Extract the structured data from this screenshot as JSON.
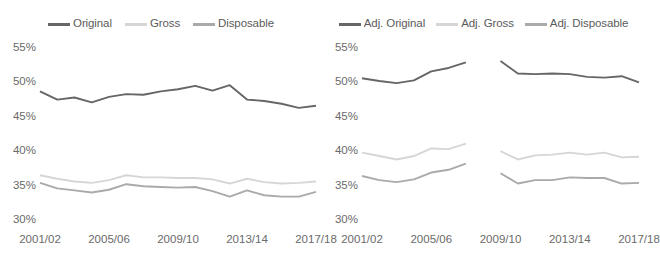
{
  "chart_data": [
    {
      "type": "line",
      "panel": "left",
      "title": "",
      "xlabel": "",
      "ylabel": "",
      "ylim": [
        30,
        55
      ],
      "ytick_labels": [
        "55%",
        "50%",
        "45%",
        "40%",
        "35%",
        "30%"
      ],
      "yticks": [
        55,
        50,
        45,
        40,
        35,
        30
      ],
      "grid": false,
      "legend_position": "top-center",
      "x": [
        "2001/02",
        "2002/03",
        "2003/04",
        "2004/05",
        "2005/06",
        "2006/07",
        "2007/08",
        "2008/09",
        "2009/10",
        "2010/11",
        "2011/12",
        "2012/13",
        "2013/14",
        "2014/15",
        "2015/16",
        "2016/17",
        "2017/18"
      ],
      "xtick_labels": [
        "2001/02",
        "2005/06",
        "2009/10",
        "2013/14",
        "2017/18"
      ],
      "xticks_index": [
        0,
        4,
        8,
        12,
        16
      ],
      "series": [
        {
          "name": "Original",
          "color": "#666666",
          "values": [
            48.7,
            47.5,
            47.8,
            47.1,
            47.9,
            48.3,
            48.2,
            48.7,
            49.0,
            49.5,
            48.8,
            49.6,
            47.5,
            47.3,
            46.9,
            46.3,
            46.6
          ]
        },
        {
          "name": "Gross",
          "color": "#d6d6d6",
          "values": [
            36.5,
            36.0,
            35.6,
            35.4,
            35.8,
            36.5,
            36.2,
            36.2,
            36.1,
            36.1,
            35.9,
            35.3,
            36.0,
            35.5,
            35.3,
            35.4,
            35.6
          ]
        },
        {
          "name": "Disposable",
          "color": "#aaaaaa",
          "values": [
            35.4,
            34.6,
            34.3,
            34.0,
            34.4,
            35.2,
            34.9,
            34.8,
            34.7,
            34.8,
            34.2,
            33.4,
            34.3,
            33.6,
            33.4,
            33.4,
            34.1
          ]
        }
      ]
    },
    {
      "type": "line",
      "panel": "right",
      "title": "",
      "xlabel": "",
      "ylabel": "",
      "ylim": [
        30,
        55
      ],
      "ytick_labels": [
        "55%",
        "50%",
        "45%",
        "40%",
        "35%",
        "30%"
      ],
      "yticks": [
        55,
        50,
        45,
        40,
        35,
        30
      ],
      "grid": false,
      "legend_position": "top-center",
      "note": "Series break between 2007/08 and 2009/10",
      "x": [
        "2001/02",
        "2002/03",
        "2003/04",
        "2004/05",
        "2005/06",
        "2006/07",
        "2007/08",
        "2008/09",
        "2009/10",
        "2010/11",
        "2011/12",
        "2012/13",
        "2013/14",
        "2014/15",
        "2015/16",
        "2016/17",
        "2017/18"
      ],
      "xtick_labels": [
        "2001/02",
        "2005/06",
        "2009/10",
        "2013/14",
        "2017/18"
      ],
      "xticks_index": [
        0,
        4,
        8,
        12,
        16
      ],
      "series": [
        {
          "name": "Adj. Original",
          "color": "#666666",
          "values": [
            50.6,
            50.2,
            49.9,
            50.3,
            51.6,
            52.1,
            52.9,
            null,
            53.1,
            51.3,
            51.2,
            51.3,
            51.2,
            50.8,
            50.7,
            50.9,
            50.0
          ]
        },
        {
          "name": "Adj. Gross",
          "color": "#d6d6d6",
          "values": [
            39.8,
            39.3,
            38.8,
            39.3,
            40.4,
            40.3,
            41.1,
            null,
            40.0,
            38.8,
            39.4,
            39.5,
            39.8,
            39.5,
            39.8,
            39.1,
            39.2
          ]
        },
        {
          "name": "Adj. Disposable",
          "color": "#aaaaaa",
          "values": [
            36.4,
            35.8,
            35.5,
            35.9,
            36.9,
            37.3,
            38.2,
            null,
            36.8,
            35.3,
            35.8,
            35.8,
            36.2,
            36.1,
            36.1,
            35.3,
            35.4
          ]
        }
      ]
    }
  ],
  "legends": {
    "left": [
      {
        "label": "Original",
        "color": "#666666"
      },
      {
        "label": "Gross",
        "color": "#d6d6d6"
      },
      {
        "label": "Disposable",
        "color": "#aaaaaa"
      }
    ],
    "right": [
      {
        "label": "Adj. Original",
        "color": "#666666"
      },
      {
        "label": "Adj. Gross",
        "color": "#d6d6d6"
      },
      {
        "label": "Adj. Disposable",
        "color": "#aaaaaa"
      }
    ]
  }
}
